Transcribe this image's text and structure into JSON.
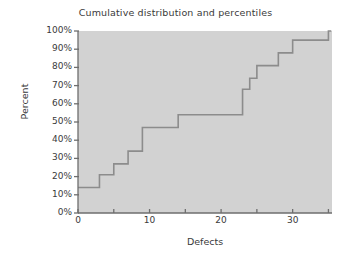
{
  "chart_data": {
    "type": "line",
    "title": "Cumulative distribution and percentiles",
    "xlabel": "Defects",
    "ylabel": "Percent",
    "xlim": [
      0,
      35.5
    ],
    "ylim": [
      0,
      100
    ],
    "grid": false,
    "legend": "none",
    "step_style": "post",
    "x_ticks": [
      0,
      5,
      10,
      15,
      20,
      25,
      30,
      35
    ],
    "x_tick_labels": [
      "0",
      "",
      "10",
      "",
      "20",
      "",
      "30",
      ""
    ],
    "y_ticks": [
      0,
      10,
      20,
      30,
      40,
      50,
      60,
      70,
      80,
      90,
      100
    ],
    "y_tick_labels": [
      "0%",
      "10%",
      "20%",
      "30%",
      "40%",
      "50%",
      "60%",
      "70%",
      "80%",
      "90%",
      "100%"
    ],
    "series": [
      {
        "name": "Cumulative percent",
        "x": [
          0,
          3,
          5,
          7,
          9,
          14,
          23,
          24,
          25,
          28,
          30,
          35,
          35.4
        ],
        "values": [
          14,
          21,
          27,
          34,
          47,
          54,
          68,
          74,
          81,
          88,
          95,
          100,
          100
        ]
      }
    ],
    "colors": {
      "plot_background": "#d2d2d2",
      "line": "#8c8c8c",
      "axis": "#6e6e6e",
      "text": "#3a3a3a",
      "figure_background": "#ffffff"
    }
  }
}
